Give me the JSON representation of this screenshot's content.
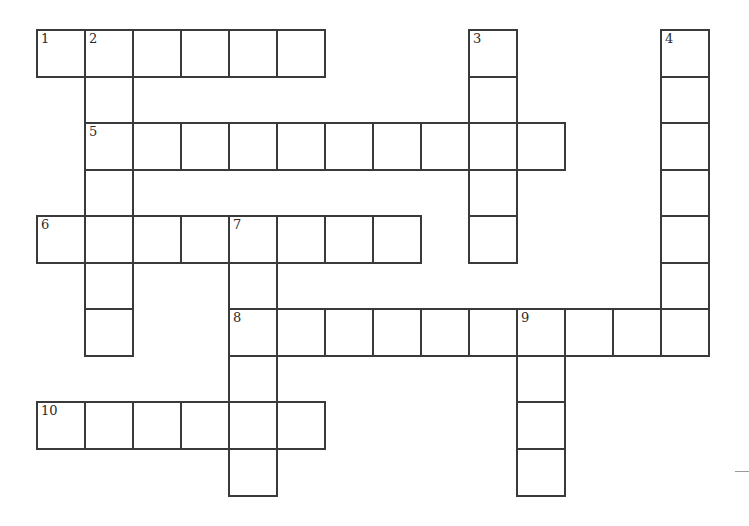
{
  "puzzle": {
    "type": "crossword",
    "grid_origin": {
      "x": 37,
      "y": 30
    },
    "cell_width": 48,
    "cell_height": 46.5,
    "border_color": "#3a3a3a",
    "entries": [
      {
        "number": "1",
        "direction": "across",
        "row": 0,
        "col": 0,
        "length": 6
      },
      {
        "number": "2",
        "direction": "down",
        "row": 0,
        "col": 1,
        "length": 7
      },
      {
        "number": "3",
        "direction": "down",
        "row": 0,
        "col": 9,
        "length": 5
      },
      {
        "number": "4",
        "direction": "down",
        "row": 0,
        "col": 13,
        "length": 7
      },
      {
        "number": "5",
        "direction": "across",
        "row": 2,
        "col": 1,
        "length": 10
      },
      {
        "number": "6",
        "direction": "across",
        "row": 4,
        "col": 0,
        "length": 8
      },
      {
        "number": "7",
        "direction": "down",
        "row": 4,
        "col": 4,
        "length": 6
      },
      {
        "number": "8",
        "direction": "across",
        "row": 6,
        "col": 4,
        "length": 10
      },
      {
        "number": "9",
        "direction": "down",
        "row": 6,
        "col": 10,
        "length": 4
      },
      {
        "number": "10",
        "direction": "across",
        "row": 8,
        "col": 0,
        "length": 6
      }
    ]
  }
}
